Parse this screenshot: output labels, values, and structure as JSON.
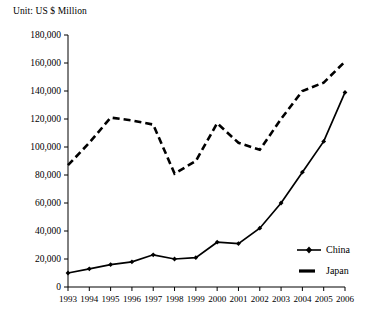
{
  "chart_data": {
    "type": "line",
    "title": "Unit: US $ Million",
    "xlabel": "",
    "ylabel": "",
    "ylim": [
      0,
      180000
    ],
    "ytick_step": 20000,
    "yticks": [
      "0",
      "20,000",
      "40,000",
      "60,000",
      "80,000",
      "100,000",
      "120,000",
      "140,000",
      "160,000",
      "180,000"
    ],
    "ytick_values": [
      0,
      20000,
      40000,
      60000,
      80000,
      100000,
      120000,
      140000,
      160000,
      180000
    ],
    "grid": false,
    "legend_position": "right-inside",
    "categories": [
      "1993",
      "1994",
      "1995",
      "1996",
      "1997",
      "1998",
      "1999",
      "2000",
      "2001",
      "2002",
      "2003",
      "2004",
      "2005",
      "2006"
    ],
    "series": [
      {
        "name": "China",
        "style": "solid",
        "marker": "diamond",
        "color": "#000000",
        "values": [
          10000,
          13000,
          16000,
          18000,
          23000,
          20000,
          21000,
          32000,
          31000,
          42000,
          60000,
          82000,
          104000,
          139000
        ]
      },
      {
        "name": "Japan",
        "style": "dashed",
        "marker": "none",
        "color": "#000000",
        "values": [
          87000,
          103000,
          121000,
          119000,
          116000,
          81000,
          90000,
          117000,
          103000,
          98000,
          120000,
          140000,
          146000,
          161000
        ]
      }
    ]
  },
  "legend": {
    "items": [
      {
        "label": "China"
      },
      {
        "label": "Japan"
      }
    ]
  },
  "axis": {
    "line_color": "#000000"
  }
}
